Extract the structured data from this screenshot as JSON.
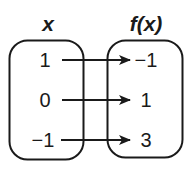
{
  "diagram": {
    "type": "mapping-diagram",
    "domain_header": "x",
    "range_header": "f(x)",
    "domain_values": [
      "1",
      "0",
      "−1"
    ],
    "range_values": [
      "−1",
      "1",
      "3"
    ],
    "mappings": [
      {
        "from": "1",
        "to": "−1"
      },
      {
        "from": "0",
        "to": "1"
      },
      {
        "from": "−1",
        "to": "3"
      }
    ]
  }
}
